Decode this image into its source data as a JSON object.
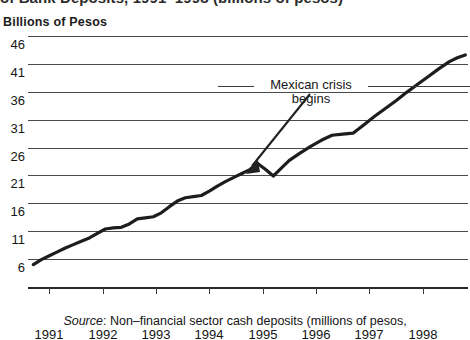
{
  "figure": {
    "clipped_title": "of Bank Deposits, 1991–1998 (billions of pesos)",
    "unit_label": "Billions of Pesos",
    "source_prefix": "Source",
    "source_text": ": Non–financial sector cash deposits (millions of pesos,"
  },
  "annotation": {
    "line1": "Mexican crisis",
    "line2": "begins"
  },
  "chart_data": {
    "type": "line",
    "title": "of Bank Deposits, 1991–1998 (billions of pesos)",
    "subtitle": "Billions of Pesos",
    "xlabel": "",
    "ylabel": "Billions of Pesos",
    "xlim": [
      1990.6,
      1998.85
    ],
    "ylim": [
      1.0,
      46.0
    ],
    "yticks": [
      46,
      41,
      36,
      31,
      26,
      21,
      16,
      11,
      6
    ],
    "ytick_labels": [
      "46",
      "41",
      "36",
      "31",
      "26",
      "21",
      "16",
      "11",
      "6"
    ],
    "xticks": [
      1991,
      1992,
      1993,
      1994,
      1995,
      1996,
      1997,
      1998
    ],
    "xtick_labels": [
      "1991",
      "1992",
      "1993",
      "1994",
      "1995",
      "1996",
      "1997",
      "1998"
    ],
    "grid": true,
    "grid_axis": "y",
    "legend": false,
    "line_color": "#1d1d1d",
    "line_width": 3.2,
    "annotations": [
      {
        "text": "Mexican crisis begins",
        "points_to_x": 1995.05,
        "points_to_y": 20.9
      }
    ],
    "series": [
      {
        "name": "Non-financial sector cash deposits",
        "x": [
          1990.7,
          1990.85,
          1991.0,
          1991.15,
          1991.3,
          1991.45,
          1991.6,
          1991.75,
          1991.9,
          1992.05,
          1992.2,
          1992.35,
          1992.5,
          1992.65,
          1992.8,
          1992.95,
          1993.1,
          1993.25,
          1993.4,
          1993.55,
          1993.7,
          1993.85,
          1994.0,
          1994.15,
          1994.3,
          1994.45,
          1994.6,
          1994.75,
          1994.9,
          1995.05,
          1995.2,
          1995.35,
          1995.5,
          1995.7,
          1995.9,
          1996.1,
          1996.3,
          1996.5,
          1996.7,
          1996.9,
          1997.1,
          1997.3,
          1997.5,
          1997.7,
          1997.9,
          1998.1,
          1998.3,
          1998.5,
          1998.65,
          1998.8
        ],
        "y": [
          5.0,
          5.9,
          6.6,
          7.3,
          8.0,
          8.6,
          9.2,
          9.8,
          10.6,
          11.4,
          11.6,
          11.7,
          12.3,
          13.2,
          13.4,
          13.6,
          14.3,
          15.4,
          16.4,
          17.0,
          17.2,
          17.4,
          18.2,
          19.1,
          19.9,
          20.6,
          21.3,
          22.0,
          23.2,
          22.1,
          20.9,
          22.3,
          23.7,
          25.0,
          26.2,
          27.3,
          28.2,
          28.4,
          28.6,
          30.1,
          31.6,
          33.0,
          34.4,
          35.9,
          37.3,
          38.7,
          40.1,
          41.4,
          42.1,
          42.6
        ]
      }
    ]
  }
}
